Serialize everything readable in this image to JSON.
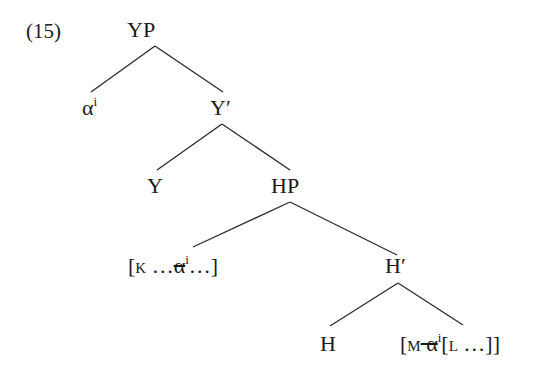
{
  "example_number": "(15)",
  "tree": {
    "root": {
      "label": "YP"
    },
    "alpha": {
      "base": "α",
      "index": "i"
    },
    "y_bar": {
      "label": "Y′"
    },
    "y_head": {
      "label": "Y"
    },
    "hp": {
      "label": "HP"
    },
    "k_phrase": {
      "open": "[",
      "cat": "K",
      "dots1": " …",
      "alpha": "α",
      "index": "i",
      "dots2": "…]"
    },
    "h_bar": {
      "label": "H′"
    },
    "h_head": {
      "label": "H"
    },
    "m_phrase": {
      "open": "[",
      "cat": "M",
      "alpha": " α",
      "index": "i",
      "inner_open": "[",
      "inner_cat": "L",
      "inner_rest": " …]]"
    }
  },
  "edges": [
    {
      "from": "YP",
      "to": "α"
    },
    {
      "from": "YP",
      "to": "Y′"
    },
    {
      "from": "Y′",
      "to": "Y"
    },
    {
      "from": "Y′",
      "to": "HP"
    },
    {
      "from": "HP",
      "to": "[K …α…]"
    },
    {
      "from": "HP",
      "to": "H′"
    },
    {
      "from": "H′",
      "to": "H"
    },
    {
      "from": "H′",
      "to": "[M α [L …]]"
    }
  ],
  "colors": {
    "ink": "#1a1a1a",
    "background": "#ffffff"
  }
}
